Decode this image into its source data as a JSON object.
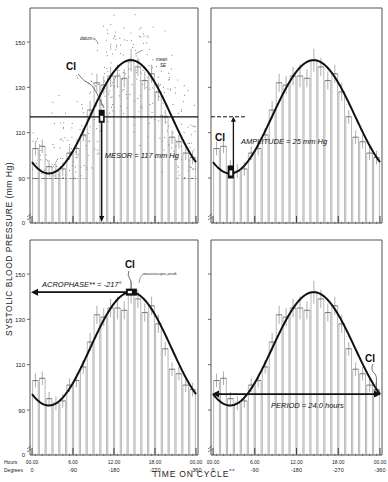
{
  "chart_data": {
    "type": "bar",
    "title": "",
    "ylabel": "SYSTOLIC BLOOD PRESSURE (mm Hg)",
    "xlabel": "TIME ON CYCLE",
    "xlabel_suffix": "**",
    "ylim": [
      0,
      170
    ],
    "ytick_labels": [
      "0",
      "90",
      "110",
      "130",
      "150"
    ],
    "x_hours_labels": [
      "00.00",
      "6.00",
      "12.00",
      "18.00",
      "00.00"
    ],
    "x_degrees_labels": [
      "0",
      "-90",
      "-180",
      "-270",
      "-360"
    ],
    "axis_row_labels": {
      "hours": "Hours",
      "degrees": "Degrees"
    },
    "categories": [
      "0",
      "1",
      "2",
      "3",
      "4",
      "5",
      "6",
      "7",
      "8",
      "9",
      "10",
      "11",
      "12",
      "13",
      "14",
      "15",
      "16",
      "17",
      "18",
      "19",
      "20",
      "21",
      "22",
      "23"
    ],
    "series": [
      {
        "name": "hourly mean ± SE",
        "values": [
          103,
          104,
          95,
          93,
          94,
          101,
          103,
          109,
          120,
          132,
          131,
          135,
          135,
          134,
          142,
          139,
          133,
          136,
          128,
          117,
          108,
          106,
          101,
          99
        ],
        "se": [
          3,
          3,
          3,
          3,
          3,
          3,
          3,
          3,
          4,
          4,
          4,
          4,
          5,
          4,
          5,
          4,
          4,
          4,
          4,
          3,
          3,
          3,
          3,
          3
        ]
      },
      {
        "name": "fitted cosine",
        "mesor": 117,
        "amplitude": 25,
        "acrophase_deg": -217,
        "period_hours": 24.0
      }
    ],
    "panels": [
      {
        "id": "mesor",
        "annotation": "MESOR = 117 mm Hg",
        "ci_label": "CI",
        "extra_labels": [
          "datum",
          "mean",
          "SE"
        ]
      },
      {
        "id": "amplitude",
        "annotation": "AMPLITUDE = 25 mm Hg",
        "ci_label": "CI"
      },
      {
        "id": "acrophase",
        "annotation": "ACROPHASE** = -217°",
        "ci_label": "CI",
        "extra_labels": [
          "macroscopic peak"
        ]
      },
      {
        "id": "period",
        "annotation": "PERIOD = 24.0 hours",
        "ci_label": "CI"
      }
    ],
    "grid": false,
    "legend": null
  }
}
